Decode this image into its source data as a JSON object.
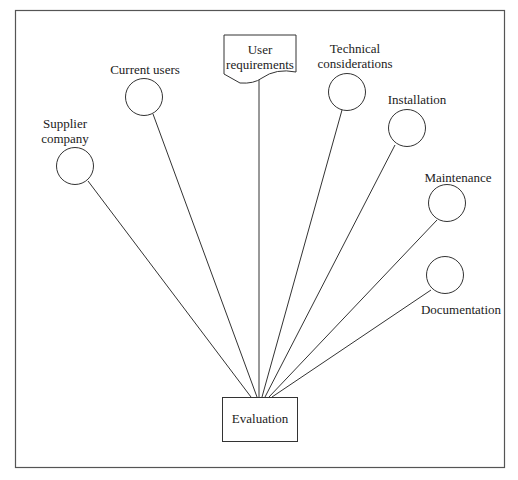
{
  "diagram": {
    "center": {
      "label": "Evaluation"
    },
    "document_node": {
      "label_line1": "User",
      "label_line2": "requirements"
    },
    "nodes": [
      {
        "id": "supplier",
        "line1": "Supplier",
        "line2": "company"
      },
      {
        "id": "current-users",
        "line1": "Current users"
      },
      {
        "id": "technical",
        "line1": "Technical",
        "line2": "considerations"
      },
      {
        "id": "installation",
        "line1": "Installation"
      },
      {
        "id": "maintenance",
        "line1": "Maintenance"
      },
      {
        "id": "documentation",
        "line1": "Documentation"
      }
    ]
  }
}
